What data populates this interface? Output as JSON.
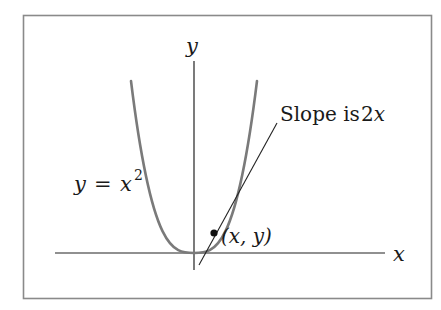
{
  "diagram": {
    "frame": {
      "x": 23,
      "y": 15,
      "width": 408,
      "height": 283,
      "stroke": "#8a8a8a"
    },
    "axes": {
      "x_label": "x",
      "y_label": "y",
      "x_axis": {
        "x1": 55,
        "x2": 385,
        "y": 253
      },
      "y_axis": {
        "x": 194,
        "y1": 61,
        "y2": 270
      },
      "color": "#222222"
    },
    "curve": {
      "label_y": "y",
      "label_eq": "=",
      "label_x": "x",
      "label_exp": "2",
      "color": "#7a7a7a",
      "vertex": [
        194,
        253
      ],
      "top_left": [
        131,
        81
      ],
      "top_right": [
        257,
        81
      ]
    },
    "tangent": {
      "label_text": "Slope is ",
      "label_math": "2x",
      "color": "#222222",
      "from": [
        199,
        265
      ],
      "to": [
        277,
        123
      ]
    },
    "point": {
      "label": "(x, y)",
      "x": 214,
      "y": 233,
      "color": "#111111"
    }
  }
}
